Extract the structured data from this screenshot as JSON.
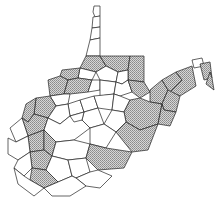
{
  "map": {
    "subject": "West Virginia county map",
    "legend": null,
    "colors": {
      "shaded_fill": "#b8b8b8",
      "unshaded_fill": "#ffffff",
      "border": "#222222"
    },
    "counties": [
      {
        "id": "hancock",
        "shaded": false,
        "points": "94,6 100,6 100,16 95,17 93,12"
      },
      {
        "id": "brooke",
        "shaded": false,
        "points": "93,17 100,16 100,27 92,28"
      },
      {
        "id": "ohio",
        "shaded": false,
        "points": "92,28 100,27 100,38 90,40"
      },
      {
        "id": "marshall",
        "shaded": false,
        "points": "90,40 100,38 100,56 86,56"
      },
      {
        "id": "wetzel",
        "shaded": true,
        "points": "86,56 100,56 106,66 96,72 80,68"
      },
      {
        "id": "monongalia",
        "shaded": true,
        "points": "100,56 130,56 128,70 118,72 106,66"
      },
      {
        "id": "preston",
        "shaded": true,
        "points": "130,56 144,56 144,82 128,80 128,70"
      },
      {
        "id": "tyler",
        "shaded": false,
        "points": "80,68 96,72 92,80 78,78"
      },
      {
        "id": "pleasants",
        "shaded": true,
        "points": "62,70 80,68 78,78 68,80 60,76"
      },
      {
        "id": "marion",
        "shaded": false,
        "points": "106,66 118,72 116,82 100,80 96,72"
      },
      {
        "id": "taylor",
        "shaded": false,
        "points": "118,72 128,70 128,80 122,84 116,82"
      },
      {
        "id": "wood",
        "shaded": true,
        "points": "48,80 60,76 68,80 64,94 50,96"
      },
      {
        "id": "ritchie",
        "shaded": true,
        "points": "68,80 78,78 92,80 88,92 70,94 64,94"
      },
      {
        "id": "doddridge",
        "shaded": false,
        "points": "92,80 100,80 100,90 88,92"
      },
      {
        "id": "harrison",
        "shaded": false,
        "points": "100,80 116,82 114,94 100,96 100,90"
      },
      {
        "id": "barbour",
        "shaded": false,
        "points": "116,82 122,84 128,80 132,92 120,96 114,94"
      },
      {
        "id": "tucker",
        "shaded": true,
        "points": "128,80 144,82 150,92 140,98 132,92"
      },
      {
        "id": "grant",
        "shaded": true,
        "points": "150,90 162,80 168,90 162,104 150,102"
      },
      {
        "id": "mineral",
        "shaded": true,
        "points": "162,80 176,72 182,80 170,92 168,90"
      },
      {
        "id": "hampshire",
        "shaded": true,
        "points": "176,72 192,66 196,86 180,96 170,92 182,80"
      },
      {
        "id": "morgan",
        "shaded": false,
        "points": "192,60 202,58 204,66 194,68"
      },
      {
        "id": "berkeley",
        "shaded": true,
        "points": "200,64 210,62 212,78 204,80"
      },
      {
        "id": "jefferson",
        "shaded": true,
        "points": "210,72 212,78 214,90 206,84"
      },
      {
        "id": "hardy",
        "shaded": true,
        "points": "168,90 180,96 176,112 164,110 162,104"
      },
      {
        "id": "wirt",
        "shaded": false,
        "points": "50,96 64,94 70,94 68,104 56,106"
      },
      {
        "id": "jackson",
        "shaded": true,
        "points": "36,98 50,96 56,106 48,118 34,114"
      },
      {
        "id": "calhoun",
        "shaded": false,
        "points": "68,104 80,100 84,112 70,116"
      },
      {
        "id": "gilmer",
        "shaded": false,
        "points": "80,100 94,96 98,108 84,112"
      },
      {
        "id": "lewis",
        "shaded": false,
        "points": "94,96 114,94 112,110 98,108"
      },
      {
        "id": "upshur",
        "shaded": false,
        "points": "114,94 120,96 130,100 124,112 112,110"
      },
      {
        "id": "randolph",
        "shaded": true,
        "points": "130,100 140,98 150,102 162,104 158,124 140,130 126,122 124,112"
      },
      {
        "id": "pendleton",
        "shaded": true,
        "points": "162,104 164,110 176,112 170,126 158,124"
      },
      {
        "id": "mason",
        "shaded": true,
        "points": "26,104 36,98 34,114 28,122 22,118"
      },
      {
        "id": "roane",
        "shaded": false,
        "points": "48,118 56,106 68,104 70,116 60,124"
      },
      {
        "id": "braxton",
        "shaded": false,
        "points": "84,112 98,108 104,124 90,128 82,120"
      },
      {
        "id": "webster",
        "shaded": false,
        "points": "104,124 112,110 124,112 126,122 116,132"
      },
      {
        "id": "putnam",
        "shaded": true,
        "points": "22,118 28,122 34,114 48,118 44,130 28,136"
      },
      {
        "id": "kanawha",
        "shaded": false,
        "points": "44,130 48,118 60,124 70,116 82,120 90,128 74,140 56,142"
      },
      {
        "id": "clay",
        "shaded": false,
        "points": "70,116 84,112 82,120 74,122"
      },
      {
        "id": "nicholas",
        "shaded": false,
        "points": "90,128 104,124 116,132 106,148 90,144"
      },
      {
        "id": "pocahontas",
        "shaded": true,
        "points": "126,122 140,130 158,124 148,150 132,152 116,132"
      },
      {
        "id": "cabell",
        "shaded": false,
        "points": "10,128 22,118 28,136 16,142"
      },
      {
        "id": "lincoln",
        "shaded": true,
        "points": "28,136 44,130 44,150 30,152"
      },
      {
        "id": "wayne",
        "shaded": false,
        "points": "8,138 16,142 28,136 30,152 18,160 8,154"
      },
      {
        "id": "boone",
        "shaded": true,
        "points": "44,130 56,142 52,156 44,150"
      },
      {
        "id": "fayette",
        "shaded": false,
        "points": "56,142 74,140 90,144 86,158 68,160 52,156"
      },
      {
        "id": "greenbrier",
        "shaded": true,
        "points": "90,144 106,148 132,152 124,168 98,170 86,158"
      },
      {
        "id": "logan",
        "shaded": true,
        "points": "30,152 44,150 52,156 46,170 32,168"
      },
      {
        "id": "mingo",
        "shaded": false,
        "points": "18,160 30,152 32,168 24,176 14,168"
      },
      {
        "id": "raleigh",
        "shaded": false,
        "points": "52,156 68,160 72,176 58,182 46,170"
      },
      {
        "id": "wyoming",
        "shaded": true,
        "points": "32,168 46,170 58,182 44,188 30,180"
      },
      {
        "id": "mcdowell",
        "shaded": false,
        "points": "14,168 24,176 30,180 44,188 34,196 18,184"
      },
      {
        "id": "summers",
        "shaded": false,
        "points": "68,160 86,158 90,172 76,178 72,176"
      },
      {
        "id": "monroe",
        "shaded": false,
        "points": "90,172 98,170 112,176 100,188 86,186 76,178"
      },
      {
        "id": "mercer",
        "shaded": false,
        "points": "44,188 58,182 72,176 76,178 86,186 70,196 52,196"
      }
    ]
  }
}
